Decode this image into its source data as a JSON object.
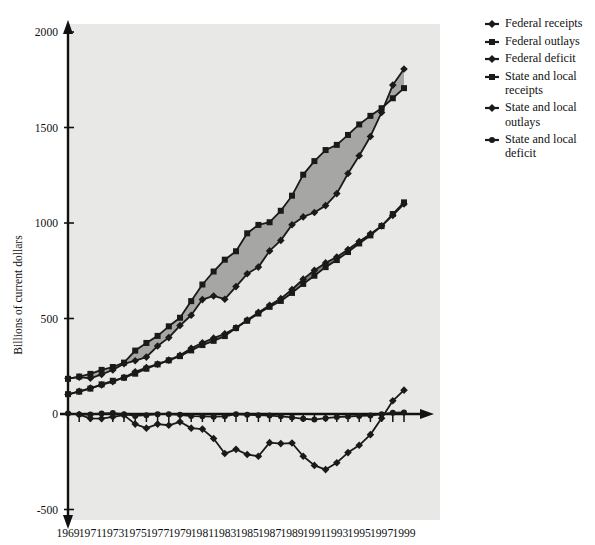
{
  "chart_data": {
    "type": "line",
    "title": "",
    "xlabel": "",
    "ylabel": "Billions of current dollars",
    "xlim": [
      1969,
      1999
    ],
    "ylim": [
      -500,
      2000
    ],
    "yticks": [
      -500,
      0,
      500,
      1000,
      1500,
      2000
    ],
    "ytick_labels": [
      "-500",
      "0",
      "500",
      "1000",
      "1500",
      "2000"
    ],
    "xticks": [
      1969,
      1970,
      1971,
      1972,
      1973,
      1974,
      1975,
      1976,
      1977,
      1978,
      1979,
      1980,
      1981,
      1982,
      1983,
      1984,
      1985,
      1986,
      1987,
      1988,
      1989,
      1990,
      1991,
      1992,
      1993,
      1994,
      1995,
      1996,
      1997,
      1998,
      1999
    ],
    "xtick_labels": [
      "1969",
      "1971",
      "1973",
      "1975",
      "1977",
      "1979",
      "1981",
      "1983",
      "1985",
      "1987",
      "1989",
      "1991",
      "1993",
      "1995",
      "1997",
      "1999"
    ],
    "xtick_label_years": [
      1969,
      1971,
      1973,
      1975,
      1977,
      1979,
      1981,
      1983,
      1985,
      1987,
      1989,
      1991,
      1993,
      1995,
      1997,
      1999
    ],
    "grid": false,
    "legend_position": "right",
    "plot_background": "#e8e8e6",
    "band_federal_color": "#a6a6a4",
    "band_state_color": "#7d7d7c",
    "line_color": "#1a1a1a",
    "x": [
      1969,
      1970,
      1971,
      1972,
      1973,
      1974,
      1975,
      1976,
      1977,
      1978,
      1979,
      1980,
      1981,
      1982,
      1983,
      1984,
      1985,
      1986,
      1987,
      1988,
      1989,
      1990,
      1991,
      1992,
      1993,
      1994,
      1995,
      1996,
      1997,
      1998,
      1999
    ],
    "series": [
      {
        "name": "Federal receipts",
        "marker": "diamond",
        "values": [
          187,
          193,
          187,
          207,
          231,
          263,
          279,
          298,
          356,
          400,
          463,
          517,
          599,
          618,
          601,
          667,
          734,
          769,
          854,
          909,
          991,
          1032,
          1055,
          1091,
          1154,
          1259,
          1352,
          1453,
          1579,
          1722,
          1806
        ]
      },
      {
        "name": "Federal outlays",
        "marker": "square",
        "values": [
          184,
          196,
          210,
          231,
          246,
          269,
          332,
          372,
          409,
          459,
          504,
          591,
          678,
          746,
          808,
          852,
          946,
          990,
          1004,
          1064,
          1143,
          1253,
          1324,
          1382,
          1409,
          1461,
          1516,
          1561,
          1601,
          1653,
          1706
        ]
      },
      {
        "name": "Federal deficit",
        "marker": "diamond",
        "values": [
          3,
          -3,
          -23,
          -24,
          -15,
          -6,
          -53,
          -74,
          -53,
          -59,
          -41,
          -74,
          -79,
          -128,
          -207,
          -185,
          -212,
          -221,
          -150,
          -155,
          -152,
          -221,
          -269,
          -291,
          -255,
          -202,
          -164,
          -108,
          -22,
          69,
          125
        ]
      },
      {
        "name": "State and local receipts",
        "marker": "square",
        "values": [
          104,
          117,
          133,
          155,
          174,
          190,
          211,
          237,
          260,
          281,
          303,
          333,
          361,
          383,
          408,
          450,
          488,
          526,
          561,
          592,
          634,
          681,
          724,
          769,
          806,
          848,
          893,
          935,
          984,
          1047,
          1108
        ]
      },
      {
        "name": "State and local outlays",
        "marker": "diamond",
        "values": [
          102,
          119,
          136,
          152,
          169,
          191,
          221,
          243,
          261,
          282,
          307,
          344,
          373,
          397,
          420,
          451,
          492,
          532,
          569,
          604,
          652,
          706,
          753,
          791,
          822,
          861,
          903,
          943,
          985,
          1040,
          1100
        ]
      },
      {
        "name": "State and local deficit",
        "marker": "circle",
        "values": [
          2,
          -2,
          -3,
          3,
          5,
          -1,
          -10,
          -6,
          -1,
          -1,
          -4,
          -11,
          -12,
          -14,
          -12,
          -1,
          -4,
          -6,
          -8,
          -12,
          -18,
          -25,
          -29,
          -22,
          -16,
          -13,
          -10,
          -8,
          -1,
          7,
          8
        ]
      }
    ],
    "bands": [
      {
        "name": "federal-band",
        "upper": "Federal outlays",
        "lower": "Federal receipts",
        "color": "#a6a6a4"
      },
      {
        "name": "state-local-band",
        "upper": "State and local receipts",
        "lower": "State and local outlays",
        "color": "#7d7d7c"
      }
    ],
    "deficit_lines_near_zero": {
      "state_and_local_line_label": "State and local deficit",
      "federal_line_label": "Federal deficit"
    }
  },
  "legend": {
    "items": [
      {
        "label": "Federal receipts",
        "marker": "diamond-line-marker"
      },
      {
        "label": "Federal outlays",
        "marker": "square-line-marker"
      },
      {
        "label": "Federal deficit",
        "marker": "diamond-line-marker"
      },
      {
        "label": "State and local\nreceipts",
        "marker": "square-line-marker"
      },
      {
        "label": "State and local\noutlays",
        "marker": "diamond-line-marker"
      },
      {
        "label": "State and local\ndeficit",
        "marker": "circle-line-marker"
      }
    ]
  },
  "axes": {
    "y_axis_title": "Billions of current dollars"
  }
}
